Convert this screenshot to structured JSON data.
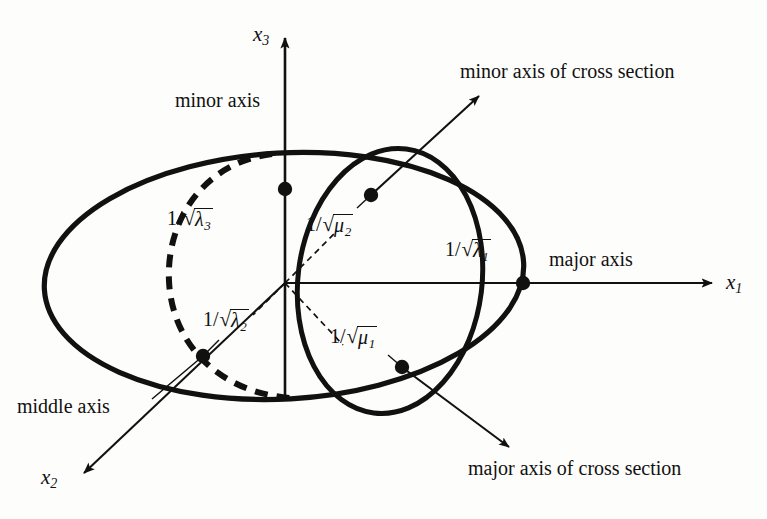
{
  "figure": {
    "background_color": "#fdfdfb",
    "ink_color": "#111111"
  },
  "axes": [
    {
      "id": "x3",
      "name": "x",
      "subscript": "3",
      "direction": "up",
      "label": "x3"
    },
    {
      "id": "x1",
      "name": "x",
      "subscript": "1",
      "direction": "right",
      "label": "x1"
    },
    {
      "id": "x2",
      "name": "x",
      "subscript": "2",
      "direction": "down-left",
      "label": "x2"
    }
  ],
  "annotations": {
    "minor_axis": "minor axis",
    "major_axis": "major axis",
    "middle_axis": "middle axis",
    "minor_axis_cross_section": "minor axis of cross section",
    "major_axis_cross_section": "major axis of cross section"
  },
  "measures": [
    {
      "id": "lambda3",
      "numerator": "1/",
      "radical": "λ",
      "sub": "3",
      "description": "semi-axis along x3"
    },
    {
      "id": "lambda2",
      "numerator": "1/",
      "radical": "λ",
      "sub": "2",
      "description": "semi-axis along x2"
    },
    {
      "id": "lambda1",
      "numerator": "1/",
      "radical": "λ",
      "sub": "1",
      "description": "semi-axis along x1"
    },
    {
      "id": "mu2",
      "numerator": "1/",
      "radical": "μ",
      "sub": "2",
      "description": "minor semi-axis of cross section"
    },
    {
      "id": "mu1",
      "numerator": "1/",
      "radical": "μ",
      "sub": "1",
      "description": "major semi-axis of cross section"
    }
  ],
  "math_parts": {
    "one_over": "1/",
    "sqrt_sign": "√",
    "lambda": "λ",
    "mu": "μ",
    "sub1": "1",
    "sub2": "2",
    "sub3": "3",
    "x": "x"
  },
  "points": [
    {
      "id": "p-lambda3",
      "x": 285,
      "y": 189,
      "label_ref": "lambda3"
    },
    {
      "id": "p-lambda2",
      "x": 203,
      "y": 356,
      "label_ref": "lambda2"
    },
    {
      "id": "p-lambda1",
      "x": 523,
      "y": 283,
      "label_ref": "lambda1"
    },
    {
      "id": "p-mu2",
      "x": 371,
      "y": 195,
      "label_ref": "mu2"
    },
    {
      "id": "p-mu1",
      "x": 402,
      "y": 367,
      "label_ref": "mu1"
    }
  ],
  "origin": {
    "x": 285,
    "y": 283
  }
}
